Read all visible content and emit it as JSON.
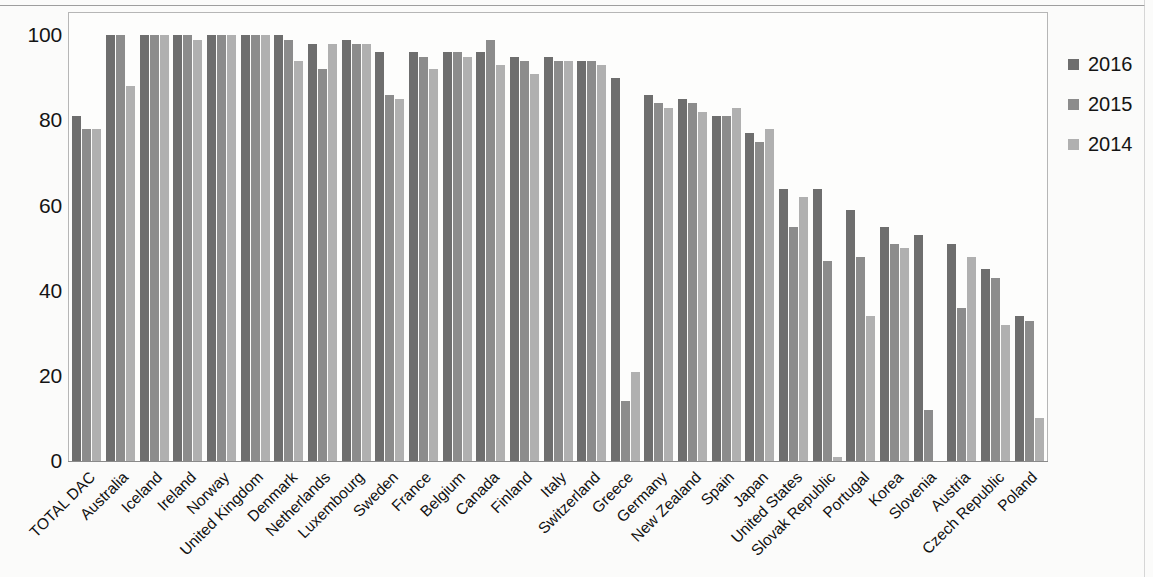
{
  "chart_data": {
    "type": "bar",
    "title": "",
    "subtitle": "",
    "xlabel": "",
    "ylabel": "",
    "ylim": [
      0,
      105
    ],
    "yticks": [
      0,
      20,
      40,
      60,
      80,
      100
    ],
    "ytick_labels": [
      "0",
      "20",
      "40",
      "60",
      "80",
      "100"
    ],
    "grid": false,
    "legend_position": "right",
    "orientation": "vertical",
    "categories": [
      "TOTAL DAC",
      "Australia",
      "Iceland",
      "Ireland",
      "Norway",
      "United Kingdom",
      "Denmark",
      "Netherlands",
      "Luxembourg",
      "Sweden",
      "France",
      "Belgium",
      "Canada",
      "Finland",
      "Italy",
      "Switzerland",
      "Greece",
      "Germany",
      "New Zealand",
      "Spain",
      "Japan",
      "United States",
      "Slovak Republic",
      "Portugal",
      "Korea",
      "Slovenia",
      "Austria",
      "Czech Republic",
      "Poland"
    ],
    "series": [
      {
        "name": "2016",
        "color": "#6e6e6e",
        "values": [
          81,
          100,
          100,
          100,
          100,
          100,
          100,
          98,
          99,
          96,
          96,
          96,
          96,
          95,
          95,
          94,
          90,
          86,
          85,
          81,
          77,
          64,
          64,
          59,
          55,
          53,
          51,
          45,
          34
        ]
      },
      {
        "name": "2015",
        "color": "#8c8c8c",
        "values": [
          78,
          100,
          100,
          100,
          100,
          100,
          99,
          92,
          98,
          86,
          95,
          96,
          99,
          94,
          94,
          94,
          14,
          84,
          84,
          81,
          75,
          55,
          47,
          48,
          51,
          12,
          36,
          43,
          33
        ]
      },
      {
        "name": "2014",
        "color": "#b0b0b0",
        "values": [
          78,
          88,
          100,
          99,
          100,
          100,
          94,
          98,
          98,
          85,
          92,
          95,
          93,
          91,
          94,
          93,
          21,
          83,
          82,
          83,
          78,
          62,
          1,
          34,
          50,
          0,
          48,
          32,
          10
        ]
      }
    ]
  },
  "legend": {
    "entries": [
      {
        "label": "2016"
      },
      {
        "label": "2015"
      },
      {
        "label": "2014"
      }
    ]
  }
}
